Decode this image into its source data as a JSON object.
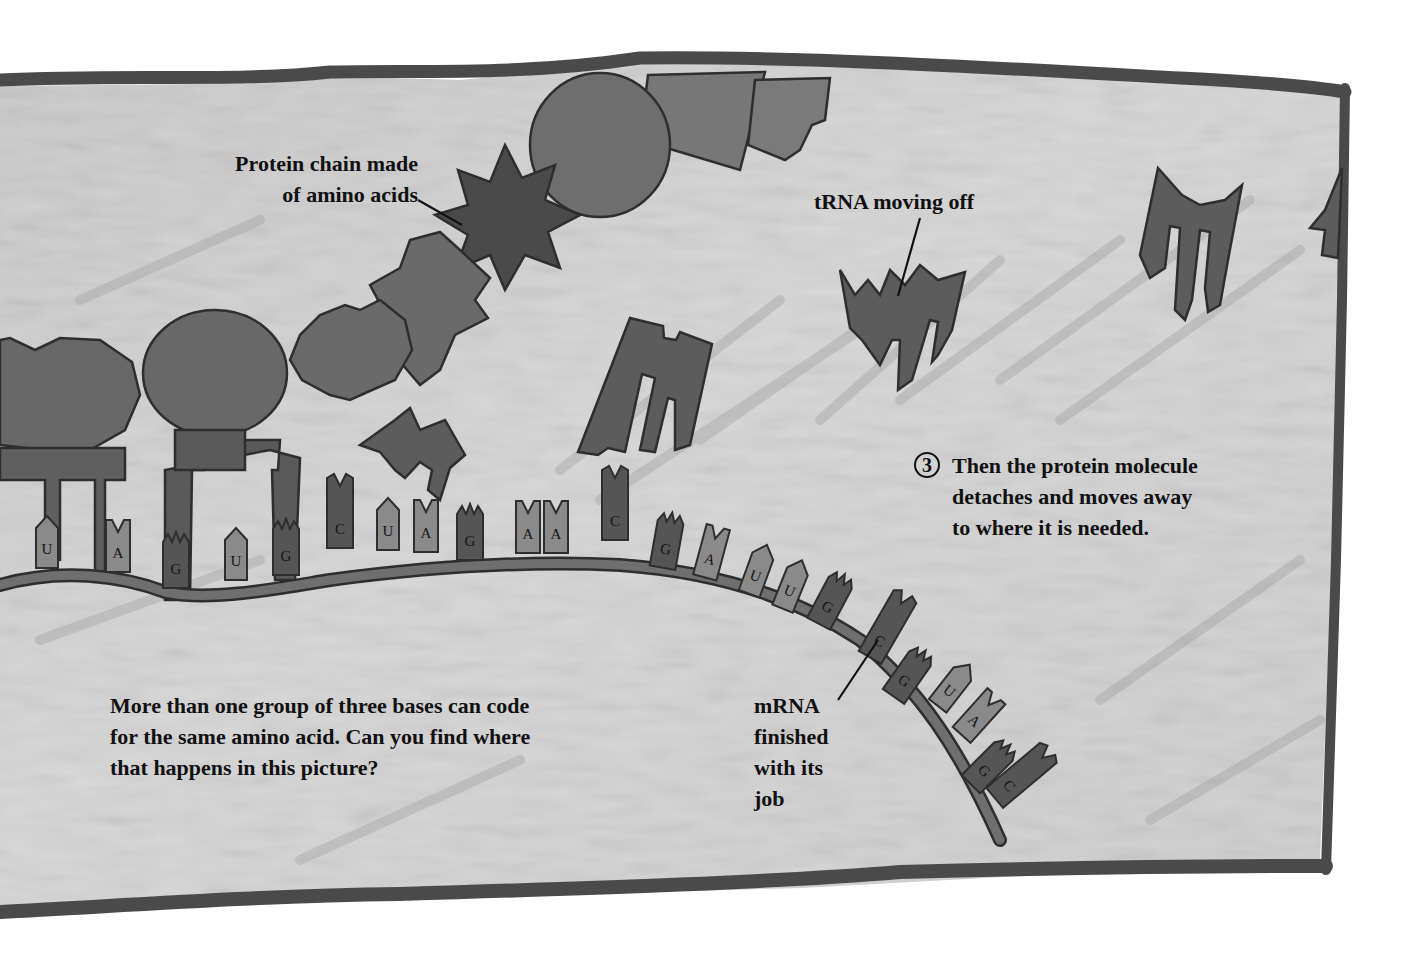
{
  "labels": {
    "protein_chain": "Protein chain made\nof amino acids",
    "trna_moving_off": "tRNA moving off",
    "step3_number": "3",
    "step3_text": "Then the protein molecule\ndetaches and moves away\nto where it is needed.",
    "question": "More than one group of three bases can code\nfor the same amino acid. Can you find where\nthat happens in this picture?",
    "mrna_finished": "mRNA\nfinished\nwith its\njob"
  },
  "mrna_bases": [
    "U",
    "A",
    "G",
    "U",
    "G",
    "C",
    "U",
    "A",
    "G",
    "A",
    "A",
    "C",
    "G",
    "A",
    "U",
    "U",
    "G",
    "C",
    "G",
    "U",
    "A",
    "G",
    "C"
  ],
  "colors": {
    "page_bg": "#ffffff",
    "paper": "#cfcfcf",
    "border": "#4a4a4a",
    "protein_mid": "#6b6b6b",
    "protein_dark": "#4f4f4f",
    "trna": "#5e5e5e",
    "base_light": "#8a8a8a",
    "base_dark": "#555555",
    "strand": "#6a6a6a",
    "ink": "#111111"
  }
}
